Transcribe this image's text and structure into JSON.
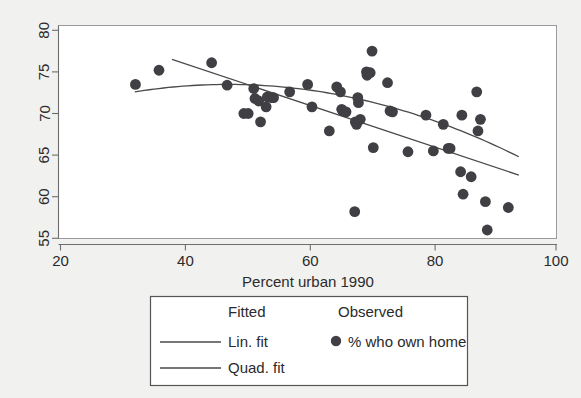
{
  "chart_data": {
    "type": "scatter",
    "title": "",
    "xlabel": "Percent urban 1990",
    "ylabel": "",
    "xlim": [
      20,
      100
    ],
    "ylim": [
      55,
      80
    ],
    "xticks": [
      20,
      40,
      60,
      80,
      100
    ],
    "yticks": [
      55,
      60,
      65,
      70,
      75,
      80
    ],
    "grid": false,
    "legend_position": "below-axis",
    "legend": {
      "col1_header": "Fitted",
      "col2_header": "Observed",
      "entries": [
        {
          "label": "Lin. fit",
          "kind": "line"
        },
        {
          "label": "Quad. fit",
          "kind": "line"
        },
        {
          "label": "% who own home",
          "kind": "marker"
        }
      ]
    },
    "series": [
      {
        "name": "% who own home",
        "kind": "scatter",
        "marker_color": "#3f3f44",
        "points": [
          [
            32.1,
            73.5
          ],
          [
            35.9,
            75.2
          ],
          [
            44.4,
            76.1
          ],
          [
            46.9,
            73.4
          ],
          [
            49.6,
            70.0
          ],
          [
            50.3,
            70.0
          ],
          [
            51.2,
            73.0
          ],
          [
            51.4,
            71.8
          ],
          [
            52.0,
            71.5
          ],
          [
            52.3,
            69.0
          ],
          [
            53.2,
            70.8
          ],
          [
            53.4,
            72.0
          ],
          [
            54.1,
            71.9
          ],
          [
            54.4,
            71.9
          ],
          [
            57.0,
            72.6
          ],
          [
            59.9,
            73.5
          ],
          [
            60.6,
            70.8
          ],
          [
            63.4,
            67.9
          ],
          [
            64.6,
            73.2
          ],
          [
            65.2,
            72.6
          ],
          [
            65.4,
            70.5
          ],
          [
            65.6,
            70.3
          ],
          [
            66.1,
            70.2
          ],
          [
            67.5,
            58.2
          ],
          [
            67.6,
            69.0
          ],
          [
            67.8,
            68.7
          ],
          [
            68.0,
            71.9
          ],
          [
            68.1,
            71.3
          ],
          [
            68.4,
            69.3
          ],
          [
            69.4,
            75.0
          ],
          [
            69.5,
            74.6
          ],
          [
            70.0,
            74.9
          ],
          [
            70.3,
            77.5
          ],
          [
            70.5,
            65.9
          ],
          [
            72.8,
            73.7
          ],
          [
            73.2,
            70.3
          ],
          [
            73.6,
            70.2
          ],
          [
            76.1,
            65.4
          ],
          [
            79.0,
            69.8
          ],
          [
            80.2,
            65.5
          ],
          [
            81.8,
            68.7
          ],
          [
            82.6,
            65.8
          ],
          [
            82.9,
            65.8
          ],
          [
            84.6,
            63.0
          ],
          [
            84.8,
            69.8
          ],
          [
            85.0,
            60.3
          ],
          [
            86.3,
            62.4
          ],
          [
            87.2,
            72.6
          ],
          [
            87.4,
            67.9
          ],
          [
            87.8,
            69.3
          ],
          [
            88.6,
            59.4
          ],
          [
            88.9,
            56.0
          ],
          [
            92.3,
            58.7
          ]
        ]
      },
      {
        "name": "Lin. fit",
        "kind": "line",
        "color": "#4a4a4a",
        "x_range": [
          38.0,
          94.0
        ],
        "y_at_x_range": [
          76.5,
          62.6
        ]
      },
      {
        "name": "Quad. fit",
        "kind": "line",
        "color": "#4a4a4a",
        "x_range": [
          32.0,
          94.0
        ],
        "coefficients_note": "concave-down curve peaking near x=50 at y=73.4, falling to y=64.8 at x=94"
      }
    ]
  },
  "axes": {
    "x_tick_labels": [
      "20",
      "40",
      "60",
      "80",
      "100"
    ],
    "y_tick_labels": [
      "55",
      "60",
      "65",
      "70",
      "75",
      "80"
    ],
    "x_axis_title": "Percent urban 1990"
  },
  "legend": {
    "fitted_header": "Fitted",
    "observed_header": "Observed",
    "lin_fit_label": "Lin. fit",
    "quad_fit_label": "Quad. fit",
    "observed_label": "% who own home"
  },
  "colors": {
    "page_background": "#f1f1ef",
    "plot_background": "#ffffff",
    "marker": "#3f3f44",
    "line": "#4a4a4a",
    "axis": "#6e6e6e",
    "text": "#2b2b2b"
  }
}
